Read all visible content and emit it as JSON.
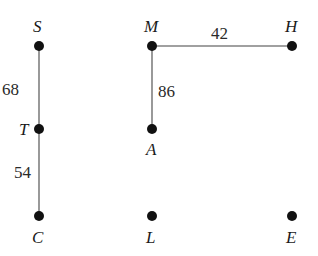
{
  "diagram": {
    "type": "graph",
    "nodes": [
      {
        "id": "S",
        "label": "S",
        "x": 39,
        "y": 46,
        "label_pos": "above"
      },
      {
        "id": "T",
        "label": "T",
        "x": 39,
        "y": 129,
        "label_pos": "left"
      },
      {
        "id": "C",
        "label": "C",
        "x": 39,
        "y": 216,
        "label_pos": "below"
      },
      {
        "id": "M",
        "label": "M",
        "x": 152,
        "y": 46,
        "label_pos": "above"
      },
      {
        "id": "A",
        "label": "A",
        "x": 152,
        "y": 129,
        "label_pos": "below"
      },
      {
        "id": "L",
        "label": "L",
        "x": 152,
        "y": 216,
        "label_pos": "below"
      },
      {
        "id": "H",
        "label": "H",
        "x": 292,
        "y": 46,
        "label_pos": "above"
      },
      {
        "id": "E",
        "label": "E",
        "x": 292,
        "y": 216,
        "label_pos": "below"
      }
    ],
    "edges": [
      {
        "from": "S",
        "to": "T",
        "weight": "68"
      },
      {
        "from": "T",
        "to": "C",
        "weight": "54"
      },
      {
        "from": "M",
        "to": "A",
        "weight": "86"
      },
      {
        "from": "M",
        "to": "H",
        "weight": "42"
      }
    ],
    "colors": {
      "edge": "#808080",
      "node": "#111111",
      "text": "#1a1a1a"
    }
  }
}
